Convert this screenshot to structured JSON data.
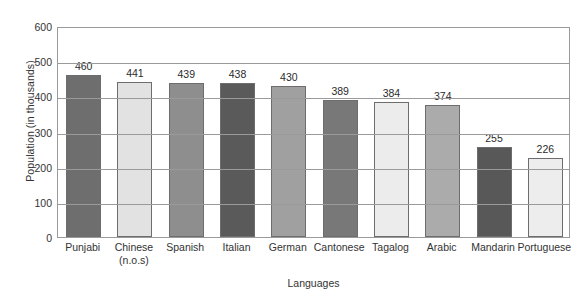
{
  "chart_data": {
    "type": "bar",
    "title": "",
    "xlabel": "Languages",
    "ylabel": "Population (in thousands)",
    "categories": [
      "Punjabi",
      "Chinese (n.o.s)",
      "Spanish",
      "Italian",
      "German",
      "Cantonese",
      "Tagalog",
      "Arabic",
      "Mandarin",
      "Portuguese"
    ],
    "category_lines": [
      [
        "Punjabi"
      ],
      [
        "Chinese",
        "(n.o.s)"
      ],
      [
        "Spanish"
      ],
      [
        "Italian"
      ],
      [
        "German"
      ],
      [
        "Cantonese"
      ],
      [
        "Tagalog"
      ],
      [
        "Arabic"
      ],
      [
        "Mandarin"
      ],
      [
        "Portuguese"
      ]
    ],
    "values": [
      460,
      441,
      439,
      438,
      430,
      389,
      384,
      374,
      255,
      226
    ],
    "value_labels": [
      "460",
      "441",
      "439",
      "438",
      "430",
      "389",
      "384",
      "374",
      "255",
      "226"
    ],
    "bar_colors": [
      "#6e6e6e",
      "#e2e2e2",
      "#8e8e8e",
      "#5a5a5a",
      "#a0a0a0",
      "#787878",
      "#ececec",
      "#ababab",
      "#585858",
      "#ededed"
    ],
    "ylim": [
      0,
      600
    ],
    "yticks": [
      0,
      100,
      200,
      300,
      400,
      500,
      600
    ],
    "ytick_labels": [
      "0",
      "100",
      "200",
      "300",
      "400",
      "500",
      "600"
    ],
    "grid": true,
    "legend": "none",
    "axis_color": "#9a9a9a",
    "bar_border_color": "#6d6d6d",
    "background": "#ffffff"
  }
}
